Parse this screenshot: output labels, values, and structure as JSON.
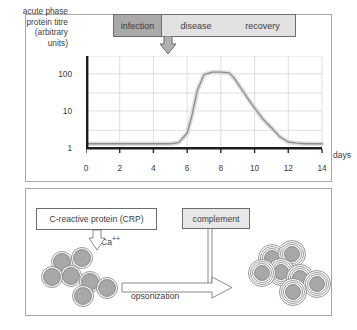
{
  "figure": {
    "panels": [
      "acute-phase-response-timecourse",
      "crp-opsonization-diagram"
    ]
  },
  "top_panel": {
    "phases": [
      {
        "label": "infection",
        "color": "#a9a9a9"
      },
      {
        "label": "disease",
        "color": "#e2e2e2"
      },
      {
        "label": "recovery",
        "color": "#e2e2e2"
      }
    ],
    "arrow_name": "infection-onset-arrow"
  },
  "chart_data": {
    "type": "line",
    "title": "",
    "ylabel": "acute phase\nprotein titre\n(arbitrary\nunits)",
    "ylabel_lines": [
      "acute phase",
      "protein titre",
      "(arbitrary",
      "units)"
    ],
    "xlabel": "days",
    "yscale": "log",
    "ylim": [
      1,
      300
    ],
    "xlim": [
      0,
      14
    ],
    "yticks": [
      1,
      10,
      100
    ],
    "ytick_labels": [
      "1",
      "10",
      "100"
    ],
    "xticks": [
      0,
      2,
      4,
      6,
      8,
      10,
      12,
      14
    ],
    "xtick_labels": [
      "0",
      "2",
      "4",
      "6",
      "8",
      "10",
      "12",
      "14"
    ],
    "grid": true,
    "legend": "none",
    "series": [
      {
        "name": "acute phase protein titre",
        "color": "#b5b5b5",
        "x": [
          0,
          1,
          2,
          3,
          4,
          5,
          5.5,
          6,
          6.3,
          6.6,
          7,
          7.5,
          8,
          8.5,
          8.8,
          9.2,
          9.8,
          10.5,
          11,
          11.5,
          12,
          12.5,
          13,
          14
        ],
        "y": [
          1.3,
          1.3,
          1.3,
          1.3,
          1.3,
          1.3,
          1.4,
          2.5,
          8,
          35,
          95,
          110,
          110,
          105,
          75,
          40,
          16,
          6,
          3.5,
          2.0,
          1.45,
          1.35,
          1.3,
          1.3
        ]
      }
    ]
  },
  "bottom_panel": {
    "crp_label": "C-reactive protein (CRP)",
    "complement_label": "complement",
    "calcium_label": "Ca",
    "calcium_superscript": "++",
    "process_label": "opsonization",
    "left_cluster_name": "bacteria-cluster-unopsonized",
    "right_cluster_name": "bacteria-cluster-opsonized",
    "bacteria_fill": "#a8a8a8",
    "bacteria_stroke": "#6d6d6d"
  }
}
